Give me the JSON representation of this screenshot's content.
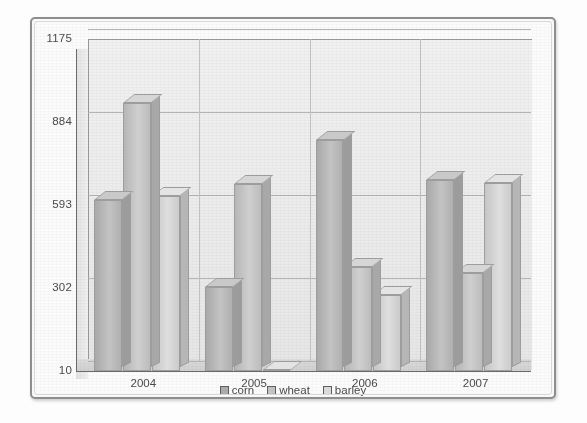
{
  "chart_data": {
    "type": "bar",
    "title": "",
    "xlabel": "",
    "ylabel": "",
    "categories": [
      "2004",
      "2005",
      "2006",
      "2007"
    ],
    "series": [
      {
        "name": "corn",
        "values": [
          610,
          305,
          820,
          680
        ]
      },
      {
        "name": "wheat",
        "values": [
          950,
          665,
          375,
          355
        ]
      },
      {
        "name": "barley",
        "values": [
          625,
          15,
          275,
          670
        ]
      }
    ],
    "ylim": [
      10,
      1175
    ],
    "yticks": [
      10,
      302,
      593,
      884,
      1175
    ],
    "ytick_labels": [
      "10",
      "302",
      "593",
      "884",
      "1175"
    ],
    "grid": true,
    "legend_position": "bottom-center",
    "style": "3d-grouped-bars-grayscale"
  },
  "axis": {
    "y_tick_labels": [
      "1175",
      "884",
      "593",
      "302",
      "10"
    ],
    "x_tick_labels": [
      "2004",
      "2005",
      "2006",
      "2007"
    ]
  },
  "legend": {
    "items": [
      {
        "label": "corn",
        "swatch": "corn-swatch"
      },
      {
        "label": "wheat",
        "swatch": "wheat-swatch"
      },
      {
        "label": "barley",
        "swatch": "barley-swatch"
      }
    ]
  },
  "colors": {
    "corn": "#adadad",
    "wheat": "#c4c4c4",
    "barley": "#dcdcdc",
    "grid": "#b4b4b4",
    "axis": "#6b6b6b",
    "plot_background": "#ebebeb",
    "frame": "#8e8e8e"
  }
}
